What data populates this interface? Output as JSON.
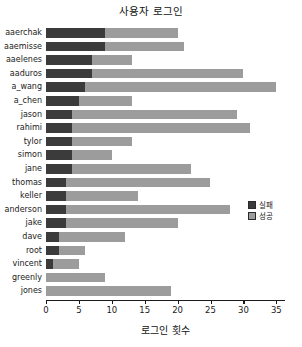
{
  "chart_data": {
    "type": "bar",
    "orientation": "horizontal",
    "stacked": true,
    "title": "사용자 로그인",
    "xlabel": "로그인 횟수",
    "ylabel": "",
    "xlim": [
      0,
      36.3
    ],
    "xticks": [
      0,
      5,
      10,
      15,
      20,
      25,
      30,
      35
    ],
    "xticklabels": [
      "0",
      "5",
      "10",
      "15",
      "20",
      "25",
      "30",
      "35"
    ],
    "grid": false,
    "legend_position": "center right",
    "categories": [
      "aaerchak",
      "aaemisse",
      "aaelenes",
      "aaduros",
      "a_wang",
      "a_chen",
      "jason",
      "rahimi",
      "tylor",
      "simon",
      "jane",
      "thomas",
      "keller",
      "anderson",
      "jake",
      "dave",
      "root",
      "vincent",
      "greenly",
      "jones"
    ],
    "series": [
      {
        "name": "실패",
        "color": "#3b3b3b",
        "values": [
          9,
          9,
          7,
          7,
          6,
          5,
          4,
          4,
          4,
          4,
          4,
          3,
          3,
          3,
          3,
          2,
          2,
          1,
          0,
          0
        ]
      },
      {
        "name": "성공",
        "color": "#9c9c9c",
        "values": [
          11,
          12,
          6,
          23,
          29,
          8,
          25,
          27,
          9,
          6,
          18,
          22,
          11,
          25,
          17,
          10,
          4,
          4,
          9,
          19
        ]
      }
    ],
    "totals": [
      20,
      21,
      13,
      30,
      35,
      13,
      29,
      31,
      13,
      10,
      22,
      25,
      14,
      28,
      20,
      12,
      6,
      5,
      9,
      19
    ]
  },
  "legend": {
    "items": [
      {
        "label": "실패",
        "color": "#3b3b3b"
      },
      {
        "label": "성공",
        "color": "#9c9c9c"
      }
    ]
  }
}
